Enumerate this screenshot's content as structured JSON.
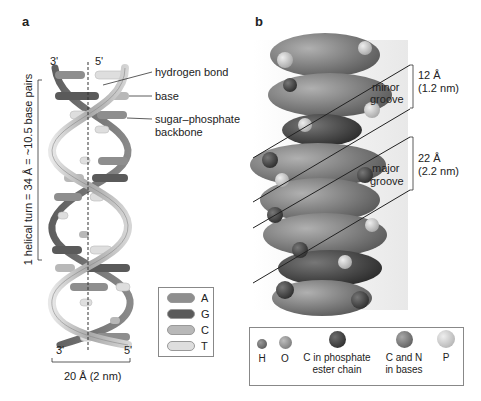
{
  "panel_a": {
    "label": "a",
    "strand_top_left": "3'",
    "strand_top_right": "5'",
    "strand_bottom_left": "3'",
    "strand_bottom_right": "5'",
    "annotations": {
      "hydrogen_bond": "hydrogen bond",
      "base": "base",
      "backbone_line1": "sugar–phosphate",
      "backbone_line2": "backbone"
    },
    "helical_turn": "1 helical turn = 34 Å = ~10.5 base pairs",
    "width_label": "20 Å (2 nm)",
    "nucleotide_legend": [
      {
        "letter": "A",
        "color": "#8e8e8e"
      },
      {
        "letter": "G",
        "color": "#5a5a5a"
      },
      {
        "letter": "C",
        "color": "#b8b8b8"
      },
      {
        "letter": "T",
        "color": "#dedede"
      }
    ]
  },
  "panel_b": {
    "label": "b",
    "minor_groove": {
      "line1": "minor",
      "line2": "groove",
      "size1": "12 Å",
      "size2": "(1.2 nm)"
    },
    "major_groove": {
      "line1": "major",
      "line2": "groove",
      "size1": "22 Å",
      "size2": "(2.2 nm)"
    },
    "atom_legend": [
      {
        "line1": "H",
        "line2": "",
        "color": "#6a6a6a",
        "size": 10
      },
      {
        "line1": "O",
        "line2": "",
        "color": "#8d8d8d",
        "size": 13
      },
      {
        "line1": "C in phosphate",
        "line2": "ester chain",
        "color": "#3c3c3c",
        "size": 17
      },
      {
        "line1": "C and N",
        "line2": "in  bases",
        "color": "#7a7a7a",
        "size": 17
      },
      {
        "line1": "P",
        "line2": "",
        "color": "#c9c9c9",
        "size": 18
      }
    ]
  }
}
